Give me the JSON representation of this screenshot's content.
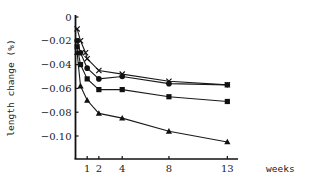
{
  "chart_data": {
    "type": "line",
    "title": "",
    "xlabel": "weeks",
    "ylabel": "length change (%)",
    "xlim": [
      0,
      13
    ],
    "ylim": [
      -0.12,
      0
    ],
    "grid": false,
    "legend": null,
    "x_ticks": [
      1,
      2,
      4,
      8,
      13
    ],
    "y_ticks": [
      0,
      -0.02,
      -0.04,
      -0.06,
      -0.08,
      -0.1
    ],
    "y_tick_labels": [
      "0",
      "−0.02",
      "−0.04",
      "−0.06",
      "−0.08",
      "−0.10"
    ],
    "series": [
      {
        "name": "cross",
        "marker": "x",
        "x": [
          0.14,
          0.43,
          0.86,
          1,
          2,
          4,
          8,
          13
        ],
        "values": [
          -0.01,
          -0.02,
          -0.03,
          -0.035,
          -0.045,
          -0.048,
          -0.054,
          -0.057
        ]
      },
      {
        "name": "circle",
        "marker": "filled-circle",
        "x": [
          0.14,
          0.43,
          1,
          2,
          4,
          8,
          13
        ],
        "values": [
          -0.02,
          -0.03,
          -0.043,
          -0.052,
          -0.05,
          -0.056,
          -0.057
        ]
      },
      {
        "name": "square",
        "marker": "filled-square",
        "x": [
          0.14,
          0.43,
          1,
          2,
          4,
          8,
          13
        ],
        "values": [
          -0.025,
          -0.04,
          -0.052,
          -0.061,
          -0.061,
          -0.067,
          -0.071
        ]
      },
      {
        "name": "triangle",
        "marker": "filled-triangle",
        "x": [
          0.14,
          0.43,
          1,
          2,
          4,
          8,
          13
        ],
        "values": [
          -0.03,
          -0.058,
          -0.07,
          -0.081,
          -0.085,
          -0.096,
          -0.105
        ]
      }
    ]
  },
  "style": {
    "line_color": "#1a1a1a",
    "marker_color": "#111111",
    "axis_color": "#111111"
  }
}
